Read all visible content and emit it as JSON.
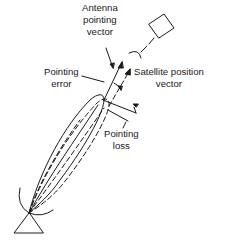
{
  "diagram": {
    "labels": {
      "antenna_pointing_vector": [
        "Antenna",
        "pointing",
        "vector"
      ],
      "pointing_error": [
        "Pointing",
        "error"
      ],
      "satellite_position_vector": [
        "Satellite position",
        "vector"
      ],
      "pointing_loss": [
        "Pointing",
        "loss"
      ]
    },
    "elements": [
      "ground-antenna",
      "antenna-beam-main-lobe",
      "antenna-beam-dashed-lobe",
      "antenna-pointing-vector-arrow",
      "satellite-position-vector-arrow",
      "satellite",
      "pointing-error-arc",
      "pointing-loss-dimension"
    ],
    "colors": {
      "stroke": "#1a1a1a",
      "background": "#ffffff"
    }
  }
}
